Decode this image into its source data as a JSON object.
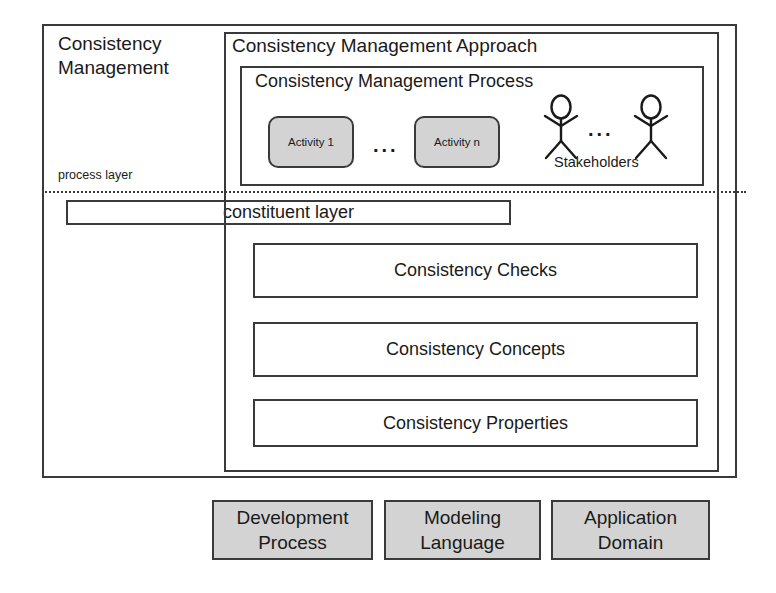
{
  "diagram": {
    "title": "Consistency Management",
    "outer_label_lines": "Consistency\nManagement",
    "layers": [
      {
        "id": "process-layer",
        "label": "process layer"
      },
      {
        "id": "constituent-layer",
        "label": "constituent layer"
      }
    ],
    "approach": {
      "title": "Consistency Management Approach",
      "process": {
        "title": "Consistency Management Process",
        "activities": [
          {
            "label": "Activity 1"
          },
          {
            "label": "Activity n"
          }
        ],
        "activity_ellipsis": "...",
        "stakeholders": {
          "label": "Stakeholders",
          "ellipsis": "...",
          "count": 2
        }
      },
      "constituents": [
        {
          "label": "Consistency Checks"
        },
        {
          "label": "Consistency Concepts"
        },
        {
          "label": "Consistency Properties"
        }
      ]
    },
    "foundations": [
      {
        "line1": "Development",
        "line2": "Process"
      },
      {
        "line1": "Modeling",
        "line2": "Language"
      },
      {
        "line1": "Application",
        "line2": "Domain"
      }
    ],
    "colors": {
      "stroke": "#3a3a3a",
      "fill_gray": "#d3d3d3",
      "background": "#ffffff",
      "text": "#1a1a1a"
    }
  }
}
